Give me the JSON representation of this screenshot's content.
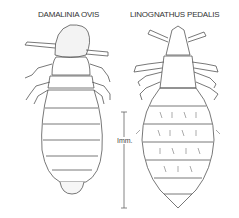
{
  "figure": {
    "specimens": [
      {
        "name": "DAMALINIA OVIS",
        "position": "left"
      },
      {
        "name": "LINOGNATHUS PEDALIS",
        "position": "right"
      }
    ],
    "scale_bar": {
      "label": "Imm.",
      "orientation": "vertical"
    },
    "colors": {
      "line": "#555555",
      "background": "#ffffff"
    }
  }
}
